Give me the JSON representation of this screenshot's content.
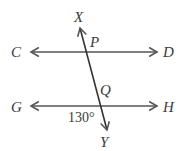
{
  "diagram": {
    "type": "parallel-lines-transversal",
    "stroke_color": "#555555",
    "text_color": "#3a3a3a",
    "lines": [
      {
        "name": "CD",
        "from": "C",
        "to": "D",
        "double_arrow": true
      },
      {
        "name": "GH",
        "from": "G",
        "to": "H",
        "double_arrow": true
      },
      {
        "name": "XY",
        "from": "X",
        "to": "Y",
        "double_arrow": true
      }
    ],
    "points": {
      "C": "C",
      "D": "D",
      "G": "G",
      "H": "H",
      "X": "X",
      "Y": "Y",
      "P": "P",
      "Q": "Q"
    },
    "intersections": [
      {
        "label": "P",
        "lines": [
          "XY",
          "CD"
        ]
      },
      {
        "label": "Q",
        "lines": [
          "XY",
          "GH"
        ]
      }
    ],
    "angle": {
      "label": "130°",
      "vertex": "Q",
      "between": [
        "QG",
        "QY"
      ]
    }
  }
}
